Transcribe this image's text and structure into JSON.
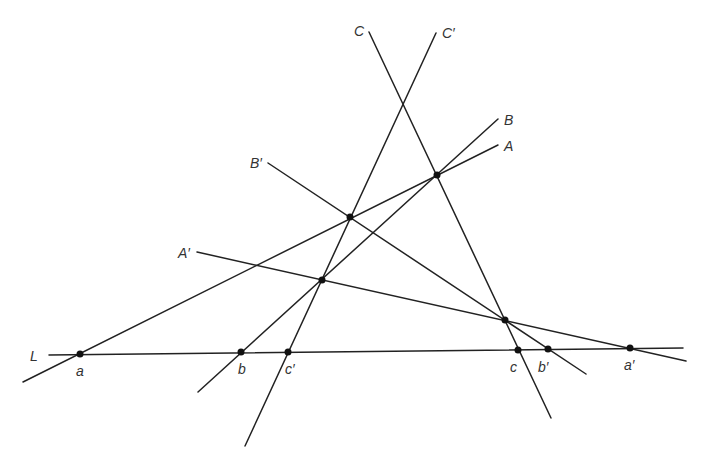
{
  "diagram": {
    "type": "projective-geometry-figure",
    "colors": {
      "stroke": "#222222",
      "point": "#111111",
      "label": "#333333",
      "background": "#ffffff"
    },
    "lines": [
      {
        "id": "L",
        "label": "L",
        "x1": 49,
        "y1": 355,
        "x2": 683,
        "y2": 348,
        "label_x": 30,
        "label_y": 361
      },
      {
        "id": "C",
        "label": "C",
        "x1": 369,
        "y1": 32,
        "x2": 551,
        "y2": 418,
        "label_x": 354,
        "label_y": 36
      },
      {
        "id": "Cp",
        "label": "C′",
        "x1": 436,
        "y1": 33,
        "x2": 245,
        "y2": 446,
        "label_x": 442,
        "label_y": 38
      },
      {
        "id": "B",
        "label": "B",
        "x1": 498,
        "y1": 119,
        "x2": 198,
        "y2": 392,
        "label_x": 504,
        "label_y": 125
      },
      {
        "id": "A",
        "label": "A",
        "x1": 498,
        "y1": 145,
        "x2": 23,
        "y2": 382,
        "label_x": 504,
        "label_y": 151
      },
      {
        "id": "Bp",
        "label": "B′",
        "x1": 268,
        "y1": 163,
        "x2": 586,
        "y2": 374,
        "label_x": 250,
        "label_y": 168
      },
      {
        "id": "Ap",
        "label": "A′",
        "x1": 197,
        "y1": 252,
        "x2": 686,
        "y2": 361,
        "label_x": 178,
        "label_y": 258
      }
    ],
    "points": [
      {
        "id": "a",
        "label": "a",
        "x": 80,
        "y": 354,
        "label_x": 76,
        "label_y": 376
      },
      {
        "id": "b",
        "label": "b",
        "x": 241,
        "y": 352,
        "label_x": 238,
        "label_y": 374
      },
      {
        "id": "cp",
        "label": "c′",
        "x": 288,
        "y": 352,
        "label_x": 285,
        "label_y": 374
      },
      {
        "id": "c",
        "label": "c",
        "x": 518,
        "y": 350,
        "label_x": 510,
        "label_y": 372
      },
      {
        "id": "bp",
        "label": "b′",
        "x": 548,
        "y": 349,
        "label_x": 538,
        "label_y": 372
      },
      {
        "id": "ap",
        "label": "a′",
        "x": 630,
        "y": 348,
        "label_x": 624,
        "label_y": 370
      },
      {
        "id": "AB",
        "label": "",
        "x": 437,
        "y": 175
      },
      {
        "id": "ACp",
        "label": "",
        "x": 350,
        "y": 217
      },
      {
        "id": "BAp",
        "label": "",
        "x": 322,
        "y": 280
      },
      {
        "id": "CBp",
        "label": "",
        "x": 505,
        "y": 320
      }
    ]
  }
}
